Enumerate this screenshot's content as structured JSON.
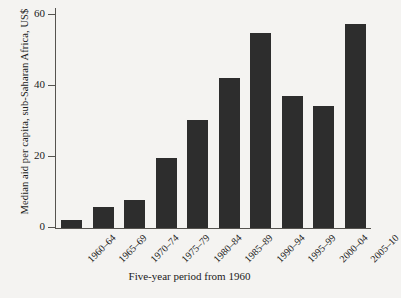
{
  "chart_data": {
    "type": "bar",
    "title": "",
    "xlabel": "Five-year period from 1960",
    "ylabel": "Median aid per capita, sub-Saharan Africa, US$",
    "categories": [
      "1960–64",
      "1965–69",
      "1970–74",
      "1975–79",
      "1980–84",
      "1985–89",
      "1990–94",
      "1995–99",
      "2000–04",
      "2005–10"
    ],
    "values": [
      2.3,
      6.0,
      8.0,
      19.8,
      30.5,
      42.3,
      55.0,
      37.3,
      34.5,
      57.5
    ],
    "ylim": [
      0,
      62
    ],
    "yticks": [
      0,
      20,
      40,
      60
    ],
    "ytick_labels": [
      "0",
      "20",
      "40",
      "60"
    ],
    "grid": false,
    "legend": "none",
    "bar_color": "#2d2d2d",
    "background_color": "#f4f3f1",
    "axis_color": "#55534f"
  }
}
